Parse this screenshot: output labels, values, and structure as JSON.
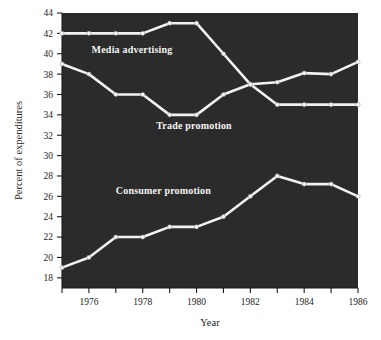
{
  "chart_data": {
    "type": "line",
    "title": "",
    "xlabel": "Year",
    "ylabel": "Percent of expenditures",
    "x": [
      1975,
      1976,
      1977,
      1978,
      1979,
      1980,
      1981,
      1982,
      1983,
      1984,
      1985,
      1986
    ],
    "xlim": [
      1975,
      1986
    ],
    "ylim": [
      17,
      44
    ],
    "grid": false,
    "legend": "inline-labels",
    "x_ticks": [
      1976,
      1978,
      1980,
      1982,
      1984,
      1986
    ],
    "x_tick_labels": [
      "1976",
      "1978",
      "1980",
      "1982",
      "1984",
      "1986"
    ],
    "x_minor_ticks": [
      1975,
      1977,
      1979,
      1981,
      1983,
      1985
    ],
    "y_ticks": [
      18,
      20,
      22,
      24,
      26,
      28,
      30,
      32,
      34,
      36,
      38,
      40,
      42,
      44
    ],
    "y_tick_labels": [
      "18",
      "20",
      "22",
      "24",
      "26",
      "28",
      "30",
      "32",
      "34",
      "36",
      "38",
      "40",
      "42",
      "44"
    ],
    "background_color": "#2b2b2b",
    "line_color": "#f2f2f0",
    "series": [
      {
        "name": "Media advertising",
        "label_x": 1976.1,
        "label_y": 40.1,
        "values": [
          42,
          42,
          42,
          42,
          43,
          43,
          40,
          37,
          35,
          35,
          35,
          35
        ]
      },
      {
        "name": "Trade promotion",
        "label_x": 1978.5,
        "label_y": 32.6,
        "values": [
          39,
          38,
          36,
          36,
          34,
          34,
          36,
          37,
          37.2,
          38.1,
          38,
          39.2
        ]
      },
      {
        "name": "Consumer promotion",
        "label_x": 1977.0,
        "label_y": 26.2,
        "values": [
          19,
          20,
          22,
          22,
          23,
          23,
          24,
          26,
          28,
          27.2,
          27.2,
          26
        ]
      }
    ]
  }
}
